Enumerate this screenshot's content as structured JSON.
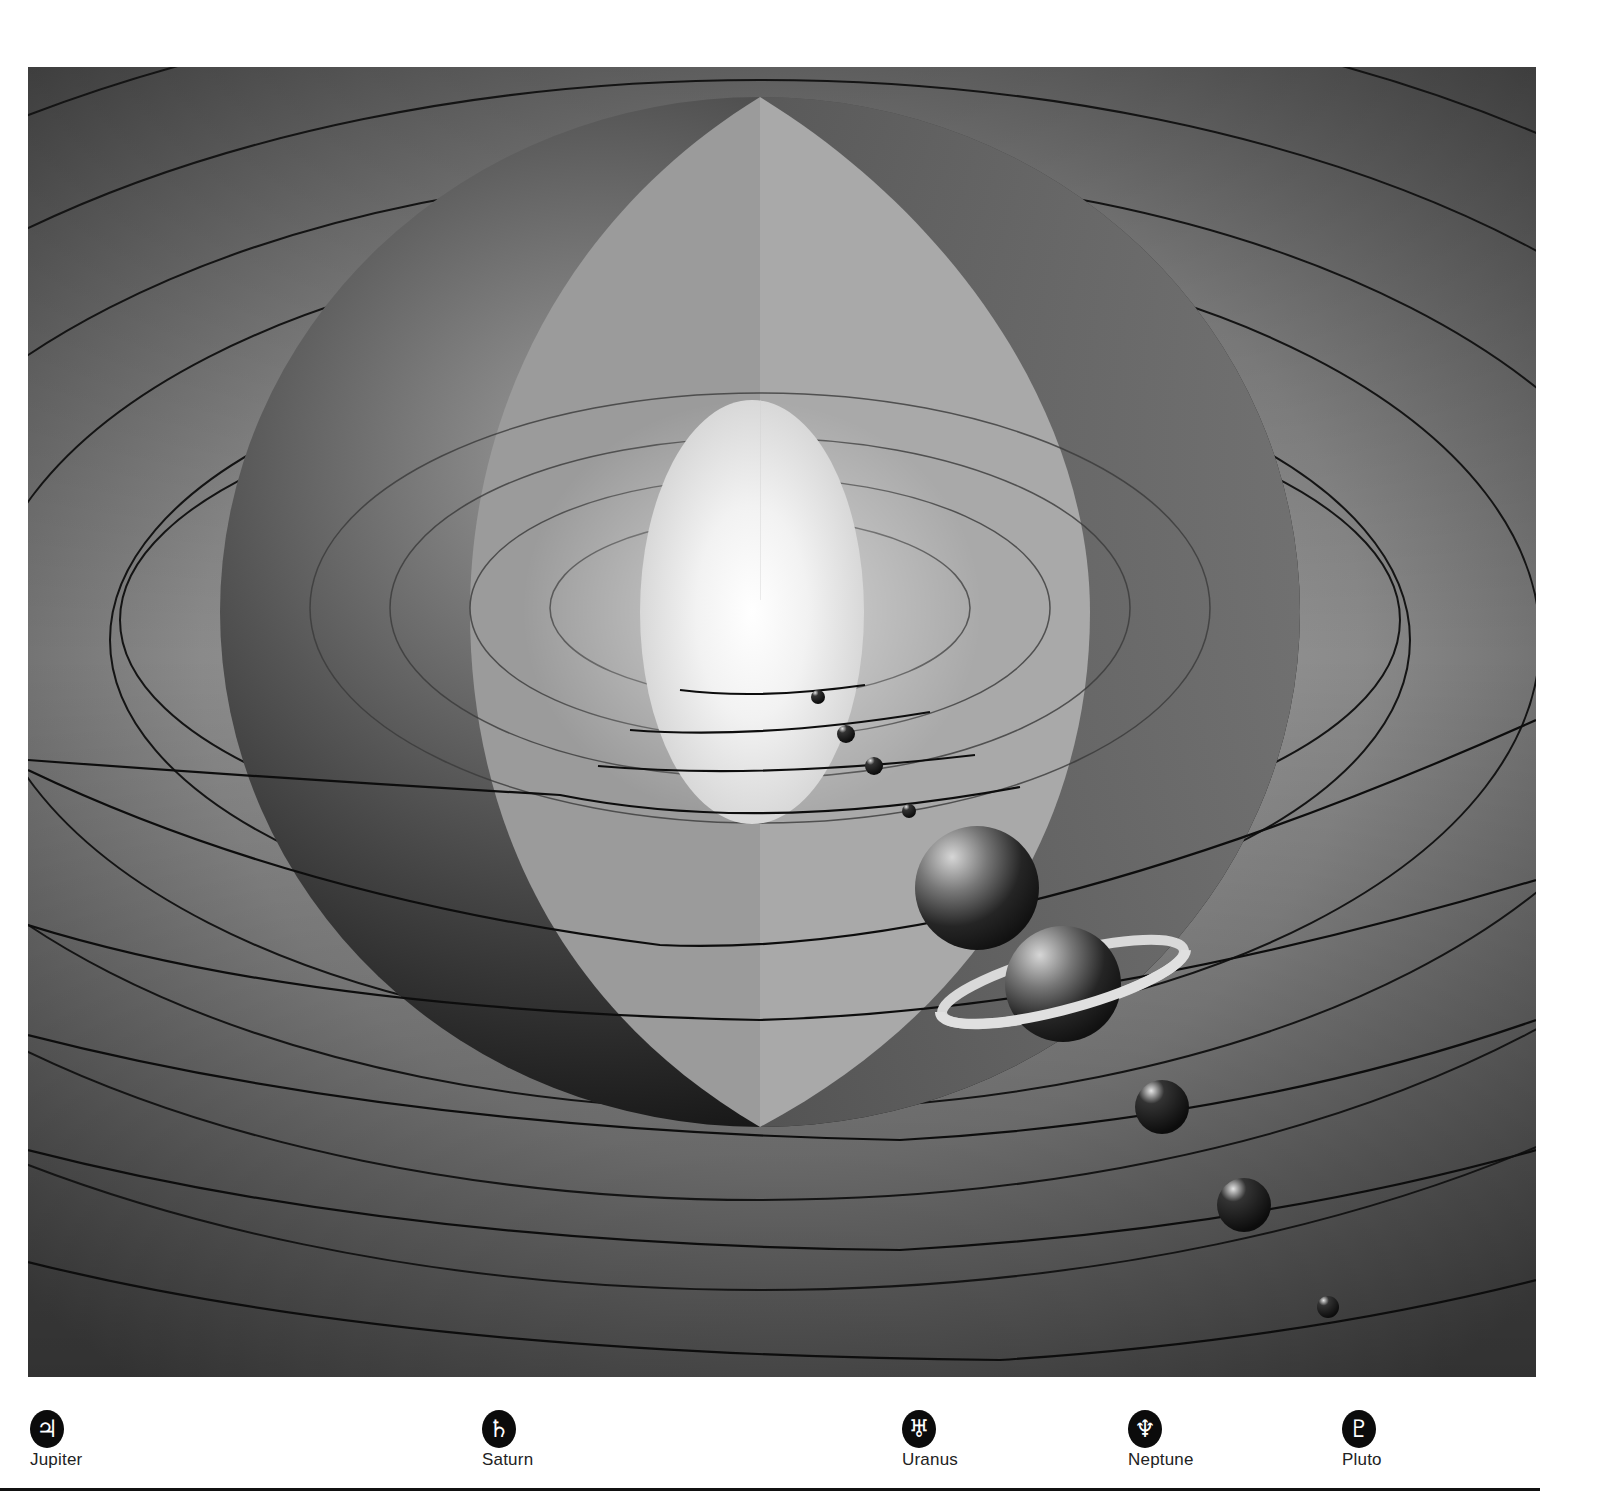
{
  "figure": {
    "colors": {
      "background_gray": "#6e6e6e",
      "dark_shell": "#1c1c1c",
      "light_shell": "#9a9a9a",
      "sun_core": "#ffffff",
      "orbit_line": "#111111"
    },
    "bodies": [
      {
        "name": "inner-planet-1",
        "x": 818,
        "y": 697,
        "r": 7
      },
      {
        "name": "inner-planet-2",
        "x": 846,
        "y": 734,
        "r": 9
      },
      {
        "name": "inner-planet-3",
        "x": 874,
        "y": 766,
        "r": 9
      },
      {
        "name": "inner-planet-4",
        "x": 909,
        "y": 811,
        "r": 7
      },
      {
        "name": "jupiter",
        "x": 977,
        "y": 888,
        "r": 62
      },
      {
        "name": "saturn",
        "x": 1063,
        "y": 984,
        "r": 58
      },
      {
        "name": "uranus",
        "x": 1162,
        "y": 1107,
        "r": 27
      },
      {
        "name": "neptune",
        "x": 1244,
        "y": 1205,
        "r": 27
      },
      {
        "name": "pluto",
        "x": 1328,
        "y": 1307,
        "r": 11
      }
    ]
  },
  "legend": {
    "items": [
      {
        "symbol": "♃",
        "label": "Jupiter"
      },
      {
        "symbol": "♄",
        "label": "Saturn"
      },
      {
        "symbol": "♅",
        "label": "Uranus"
      },
      {
        "symbol": "♆",
        "label": "Neptune"
      },
      {
        "symbol": "♇",
        "label": "Pluto"
      }
    ]
  }
}
